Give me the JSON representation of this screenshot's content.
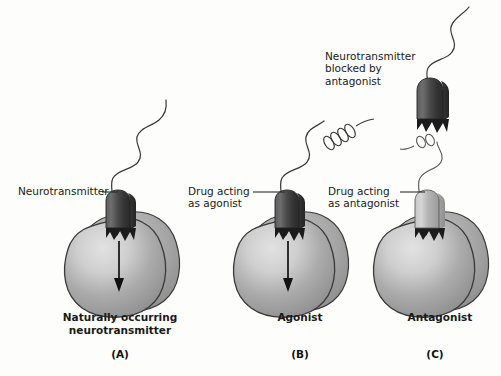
{
  "figure": {
    "background_color": "#fdfdfb",
    "ink_color": "#1a1a1a"
  },
  "colors": {
    "cell_body_mid": "#a9a9a9",
    "cell_body_light": "#d8d8d8",
    "cell_body_dark": "#808080",
    "cell_outline": "#3a3a3a",
    "molecule_dark": "#4a4a4a",
    "molecule_darker": "#2b2b2b",
    "molecule_light": "#b5b5b5",
    "tail_stroke": "#333333",
    "arrow": "#111111",
    "text": "#1a1a1a"
  },
  "annotations": {
    "neurotransmitter": "Neurotransmitter",
    "drug_agonist_line1": "Drug acting",
    "drug_agonist_line2": "as agonist",
    "drug_antagonist_line1": "Drug acting",
    "drug_antagonist_line2": "as antagonist",
    "blocked_line1": "Neurotransmitter",
    "blocked_line2": "blocked by",
    "blocked_line3": "antagonist"
  },
  "panels": [
    {
      "letter": "(A)",
      "title_line1": "Naturally occurring",
      "title_line2": "neurotransmitter",
      "molecule": "neurotransmitter",
      "molecule_fill": "dark",
      "tail_type": "wavy",
      "receptor_activated": true,
      "signal_arrow": true
    },
    {
      "letter": "(B)",
      "title_line1": "Agonist",
      "title_line2": "",
      "molecule": "drug-agonist",
      "molecule_fill": "dark",
      "tail_type": "wavy-with-spiral",
      "receptor_activated": true,
      "signal_arrow": true
    },
    {
      "letter": "(C)",
      "title_line1": "Antagonist",
      "title_line2": "",
      "molecule": "drug-antagonist",
      "molecule_fill": "light",
      "tail_type": "wavy-with-small-spiral",
      "receptor_activated": false,
      "signal_arrow": false,
      "blocked_molecule": {
        "molecule": "neurotransmitter",
        "molecule_fill": "dark",
        "tail_type": "wavy",
        "bound": false
      }
    }
  ],
  "icons": {
    "signal_arrow": "down-arrow-icon",
    "leader_line": "leader-line-icon"
  }
}
